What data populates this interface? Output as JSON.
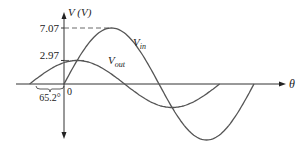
{
  "diagram": {
    "title": "",
    "y_axis_label": "V (V)",
    "x_axis_label": "θ",
    "origin_label": "0",
    "phase_label": "65.2°",
    "levels": [
      {
        "label": "7.07",
        "value": 7.07
      },
      {
        "label": "2.97",
        "value": 2.97
      }
    ],
    "curves": [
      {
        "name": "V_in",
        "label_main": "V",
        "label_sub": "in",
        "amplitude": 7.07,
        "phase_deg": 0
      },
      {
        "name": "V_out",
        "label_main": "V",
        "label_sub": "out",
        "amplitude": 2.97,
        "phase_deg": 65.2
      }
    ],
    "colors": {
      "axis": "#333333",
      "curve": "#555555",
      "dash": "#444444"
    }
  }
}
